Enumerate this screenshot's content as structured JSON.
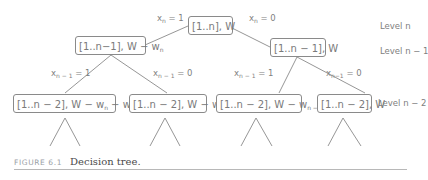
{
  "diagram": {
    "nodes": {
      "root": {
        "text": "[1..n], W"
      },
      "left1": {
        "pre": "[1..n−1], W − w",
        "sub": "n"
      },
      "right1": {
        "text": "[1..n − 1], W"
      },
      "ll2": {
        "pre": "[1..n − 2], W − w",
        "sub1": "n",
        "mid": " − w",
        "sub2": "n − 1"
      },
      "lr2": {
        "pre": "[1..n − 2], W − w",
        "sub": "n"
      },
      "rl2": {
        "pre": "[1..n − 2], W − w",
        "sub": "n − 1"
      },
      "rr2": {
        "text": "[1..n − 2], W"
      }
    },
    "edge_labels": {
      "root_left": {
        "var": "x",
        "sub": "n",
        "val": " = 1"
      },
      "root_right": {
        "var": "x",
        "sub": "n",
        "val": " = 0"
      },
      "left1_left": {
        "var": "x",
        "sub": "n − 1",
        "val": " = 1"
      },
      "left1_right": {
        "var": "x",
        "sub": "n − 1",
        "val": " = 0"
      },
      "right1_left": {
        "var": "x",
        "sub": "n − 1",
        "val": " = 1"
      },
      "right1_right": {
        "var": "x",
        "sub": "n−1",
        "val": " = 0"
      }
    },
    "levels": [
      "Level n",
      "Level n − 1",
      "Level n − 2"
    ]
  },
  "caption": {
    "number": "FIGURE 6.1",
    "text": "Decision tree."
  },
  "colors": {
    "line": "#8a8a8a",
    "text": "#7a7a7a",
    "caption_number": "#9aa0a6",
    "caption_text": "#4a4a4a"
  }
}
